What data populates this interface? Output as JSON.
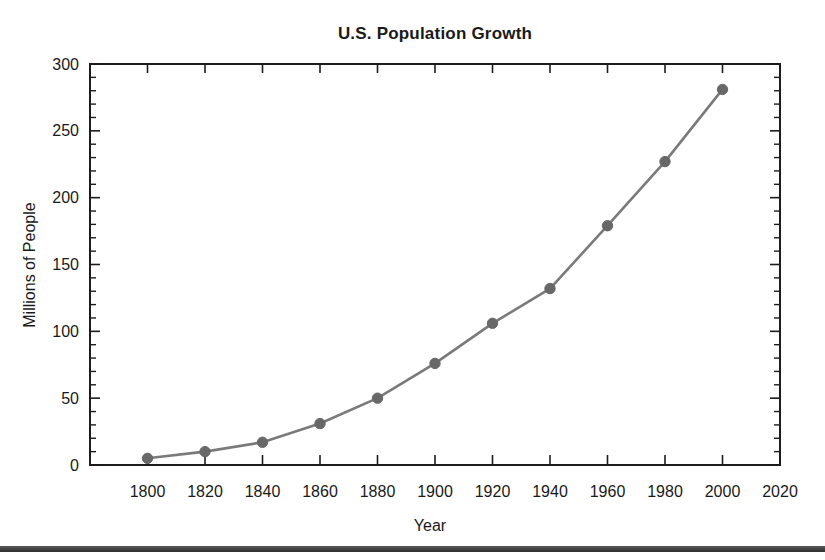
{
  "chart_data": {
    "type": "line",
    "title": "U.S. Population Growth",
    "xlabel": "Year",
    "ylabel": "Millions of People",
    "x": [
      1800,
      1820,
      1840,
      1860,
      1880,
      1900,
      1920,
      1940,
      1960,
      1980,
      2000
    ],
    "values": [
      5,
      10,
      17,
      31,
      50,
      76,
      106,
      132,
      179,
      227,
      281
    ],
    "series_name": "U.S. population (millions of people)",
    "xlim": [
      1780,
      2020
    ],
    "ylim": [
      0,
      300
    ],
    "x_tick_labels": [
      "1800",
      "1820",
      "1840",
      "1860",
      "1880",
      "1900",
      "1920",
      "1940",
      "1960",
      "1980",
      "2000",
      "2020"
    ],
    "y_tick_labels": [
      "0",
      "50",
      "100",
      "150",
      "200",
      "250",
      "300"
    ],
    "y_minor_tick_step": 10,
    "grid": false,
    "legend": false,
    "marker": "circle"
  },
  "style": {
    "line_color": "#7a7a7a",
    "marker_color": "#686868",
    "axis_color": "#1c1c1c",
    "text_color": "#1a1a1a",
    "bottom_rule_color": "#3a3a3a",
    "background": "#ffffff"
  }
}
